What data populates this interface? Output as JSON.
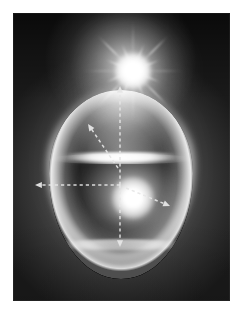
{
  "figure": {
    "canvas": {
      "width": 243,
      "height": 316,
      "background_color": "#ffffff"
    },
    "frame": {
      "left": 13,
      "top": 13,
      "width": 217,
      "height": 288,
      "background_color": "#3d3d3d",
      "corner_color": "#1a1a1a",
      "midfield_color": "#686868"
    },
    "elements": {
      "starburst": {
        "name": "sun-starburst",
        "center_x": 120,
        "center_y": 58,
        "ray_count": 16,
        "long_ray_length": 58,
        "short_ray_length": 34,
        "core_color": "#ffffff",
        "glow_color": "#f2f2f2"
      },
      "body": {
        "name": "ellipsoid-body",
        "center_x": 108,
        "center_y": 171,
        "width": 144,
        "height": 189,
        "fill_color": "#1c1c1c",
        "rim_color": "#ffffff",
        "shape": "egg"
      },
      "bands": [
        {
          "name": "upper-latitude-band",
          "y": 143,
          "brightness": "high"
        },
        {
          "name": "lower-latitude-band",
          "y": 232,
          "brightness": "high"
        }
      ],
      "core": {
        "name": "central-core-glow",
        "center_x": 120,
        "center_y": 185,
        "radius": 26,
        "color": "#ffffff"
      }
    },
    "arrows": [
      {
        "name": "arrow-west",
        "direction": "left",
        "from_x": 120,
        "from_y": 185,
        "to_x": 35,
        "to_y": 185,
        "style": "dashed",
        "color": "#e6e6e6"
      },
      {
        "name": "arrow-north",
        "direction": "up",
        "from_x": 120,
        "from_y": 185,
        "to_x": 120,
        "to_y": 86,
        "style": "dashed",
        "color": "#e6e6e6"
      },
      {
        "name": "arrow-south",
        "direction": "down",
        "from_x": 120,
        "from_y": 185,
        "to_x": 120,
        "to_y": 247,
        "style": "dashed",
        "color": "#e6e6e6"
      },
      {
        "name": "arrow-northwest",
        "direction": "up-left",
        "from_x": 118,
        "from_y": 168,
        "to_x": 88,
        "to_y": 124,
        "style": "dashed",
        "color": "#e6e6e6"
      },
      {
        "name": "arrow-southeast",
        "direction": "down-right",
        "from_x": 126,
        "from_y": 188,
        "to_x": 170,
        "to_y": 206,
        "style": "dashed",
        "color": "#e6e6e6"
      }
    ]
  }
}
